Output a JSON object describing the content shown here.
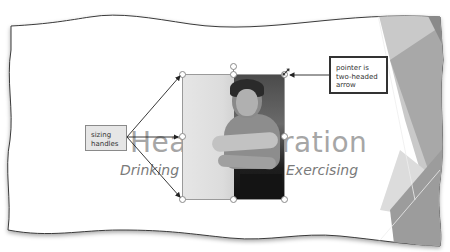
{
  "slide": {
    "title_left": "Hea",
    "title_right": "ration",
    "subtitle_left": "Drinking",
    "subtitle_right": "Exercising"
  },
  "picture": {
    "description": "woman stretching arm (grayscale photo)",
    "selected": true
  },
  "callouts": {
    "sizing_handles": {
      "line1": "sizing",
      "line2": "handles"
    },
    "pointer": {
      "line1": "pointer is",
      "line2": "two-headed",
      "line3": "arrow"
    }
  },
  "icons": {
    "rotation_handle": "rotate-handle-icon",
    "resize_pointer": "two-headed-arrow-icon"
  },
  "colors": {
    "title_gray": "#a6a6a6",
    "subtitle_gray": "#7a7a7a",
    "theme_shape_gray": "#9c9c9c",
    "callout_fill": "#e6e6e6"
  }
}
